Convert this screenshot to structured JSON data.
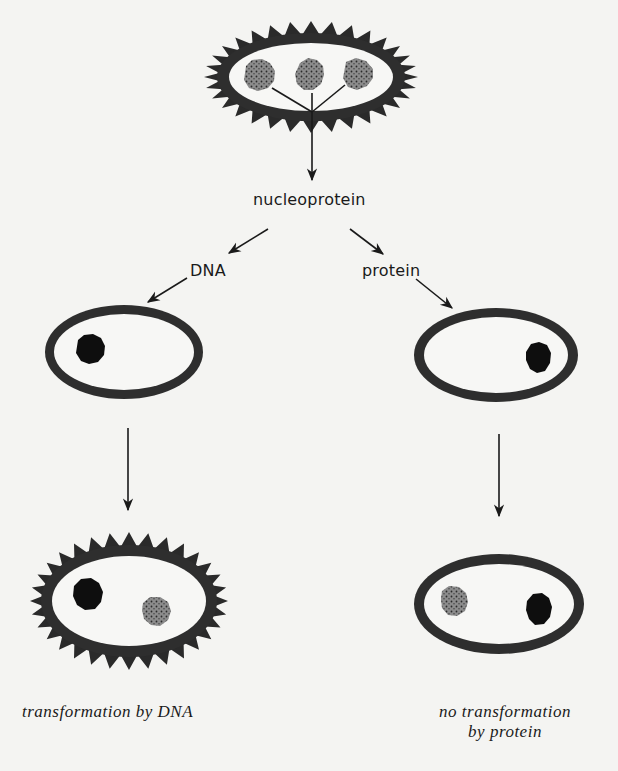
{
  "diagram": {
    "type": "flow",
    "title": "",
    "colors": {
      "background": "#f4f4f2",
      "cell_wall": "#2e2e2e",
      "capsule_spikes": "#2a2a2a",
      "nucleoprotein_gray": "#8a8a8a",
      "dna_black": "#0e0e0e",
      "ink": "#1a1a1a"
    },
    "nodes": [
      {
        "id": "donor-cell",
        "kind": "capsulated cell",
        "contents": [
          "gray particle",
          "gray particle",
          "gray particle"
        ]
      },
      {
        "id": "nucleoprotein",
        "label": "nucleoprotein"
      },
      {
        "id": "dna",
        "label": "DNA"
      },
      {
        "id": "protein",
        "label": "protein"
      },
      {
        "id": "recipient-dna",
        "kind": "non-capsulated cell",
        "contents": [
          "black particle"
        ]
      },
      {
        "id": "recipient-protein",
        "kind": "non-capsulated cell",
        "contents": [
          "black particle"
        ]
      },
      {
        "id": "result-dna",
        "kind": "capsulated cell",
        "contents": [
          "black particle",
          "gray particle"
        ]
      },
      {
        "id": "result-protein",
        "kind": "non-capsulated cell",
        "contents": [
          "gray particle",
          "black particle"
        ]
      }
    ],
    "edges": [
      [
        "donor-cell",
        "nucleoprotein"
      ],
      [
        "nucleoprotein",
        "dna"
      ],
      [
        "nucleoprotein",
        "protein"
      ],
      [
        "dna",
        "recipient-dna"
      ],
      [
        "protein",
        "recipient-protein"
      ],
      [
        "recipient-dna",
        "result-dna"
      ],
      [
        "recipient-protein",
        "result-protein"
      ]
    ],
    "labels": {
      "nucleoprotein": "nucleoprotein",
      "dna": "DNA",
      "protein": "protein",
      "caption_left": "transformation by DNA",
      "caption_right_line1": "no transformation",
      "caption_right_line2": "by protein"
    }
  }
}
